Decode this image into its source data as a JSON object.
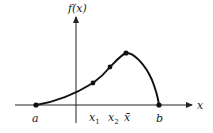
{
  "figure": {
    "y_axis_label": "f(x)",
    "x_axis_label": "x",
    "points": [
      {
        "name": "a",
        "label": "a"
      },
      {
        "name": "x1",
        "label": "x",
        "sub": "1"
      },
      {
        "name": "x2",
        "label": "x",
        "sub": "2"
      },
      {
        "name": "xbar",
        "label": "x̄"
      },
      {
        "name": "b",
        "label": "b"
      }
    ],
    "colors": {
      "curve": "#111111",
      "axis": "#222222"
    }
  }
}
